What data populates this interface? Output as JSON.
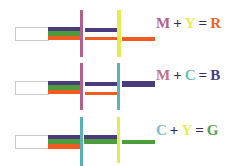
{
  "colors": {
    "purple": "#4b3b7c",
    "green": "#4d9c3b",
    "orange": "#f25a1f",
    "magenta": "#b2608f",
    "yellow": "#e6ec4f",
    "cyan": "#5cb1b2",
    "red": "#f0602a",
    "blue": "#4a3d7d",
    "green_text": "#5aa04a"
  },
  "diagrams": [
    {
      "name": "magenta-plus-yellow",
      "equation": {
        "a": "M",
        "plus": "+",
        "b": "Y",
        "equals": "=",
        "result": "R"
      },
      "equation_colors": {
        "a": "#b2608f",
        "b": "#e6ec4f",
        "result": "#f0602a"
      },
      "filter1": "magenta",
      "filter2": "yellow"
    },
    {
      "name": "magenta-plus-cyan",
      "equation": {
        "a": "M",
        "plus": "+",
        "b": "C",
        "equals": "=",
        "result": "B"
      },
      "equation_colors": {
        "a": "#c2708f",
        "b": "#6cc1b2",
        "result": "#4a3d7d"
      },
      "filter1": "magenta",
      "filter2": "cyan"
    },
    {
      "name": "cyan-plus-yellow",
      "equation": {
        "a": "C",
        "plus": "+",
        "b": "Y",
        "equals": "=",
        "result": "G"
      },
      "equation_colors": {
        "a": "#7cb9c9",
        "b": "#e6ec4f",
        "result": "#5aa04a"
      },
      "filter1": "cyan",
      "filter2": "yellow"
    }
  ]
}
